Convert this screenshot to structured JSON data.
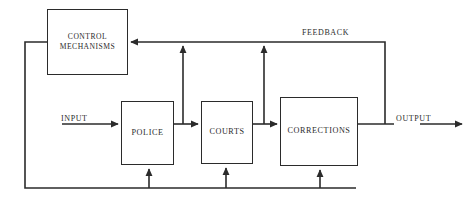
{
  "diagram": {
    "type": "block-flow-diagram",
    "stroke_color": "#2b2b2b",
    "background_color": "#ffffff",
    "nodes": [
      {
        "id": "control",
        "label": "CONTROL\nMECHANISMS"
      },
      {
        "id": "police",
        "label": "POLICE"
      },
      {
        "id": "courts",
        "label": "COURTS"
      },
      {
        "id": "corrections",
        "label": "CORRECTIONS"
      }
    ],
    "edge_labels": {
      "input": "INPUT",
      "output": "OUTPUT",
      "feedback": "FEEDBACK"
    },
    "connections": [
      {
        "from": "input",
        "to": "police",
        "arrow": true
      },
      {
        "from": "police",
        "to": "courts",
        "arrow": true
      },
      {
        "from": "courts",
        "to": "corrections",
        "arrow": true
      },
      {
        "from": "corrections",
        "to": "output",
        "arrow": true
      },
      {
        "from": "output",
        "to": "control",
        "arrow": true,
        "label": "FEEDBACK"
      },
      {
        "from": "feedback-line",
        "to": "police-top",
        "arrow": true
      },
      {
        "from": "feedback-line",
        "to": "courts-top",
        "arrow": true
      },
      {
        "from": "control",
        "to": "police-bottom",
        "arrow": true
      },
      {
        "from": "control",
        "to": "courts-bottom",
        "arrow": true
      },
      {
        "from": "control",
        "to": "corrections-bottom",
        "arrow": true
      }
    ]
  }
}
